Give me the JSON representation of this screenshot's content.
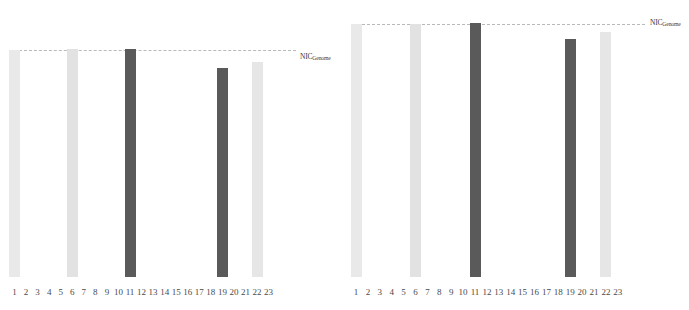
{
  "figure": {
    "width": 689,
    "height": 310,
    "background": "#ffffff"
  },
  "threshold": {
    "label_main": "NIC",
    "label_sub": "Genome",
    "line_color": "#b9b9b9",
    "line_style": "dashed"
  },
  "colors": {
    "light_bar": "#e8e8e8",
    "medium_bar": "#dcdcdc",
    "dark_bar": "#5a5a5a",
    "axis_text": "#4a4a4a"
  },
  "chart_data": [
    {
      "type": "bar",
      "name": "left-panel",
      "title": "",
      "xlabel": "",
      "ylabel": "",
      "grid": false,
      "legend": "none",
      "annotations": [
        "NIC_Genome"
      ],
      "threshold_value": 1.0,
      "ylim": [
        0,
        1.08
      ],
      "categories": [
        "1",
        "2",
        "3",
        "4",
        "5",
        "6",
        "7",
        "8",
        "9",
        "10",
        "11",
        "12",
        "13",
        "14",
        "15",
        "16",
        "17",
        "18",
        "19",
        "20",
        "21",
        "22",
        "23"
      ],
      "values": [
        1.0,
        0,
        0,
        0,
        0,
        1.0,
        0,
        0,
        0,
        0,
        1.0,
        0,
        0,
        0,
        0,
        0,
        0,
        0,
        0.92,
        0,
        0,
        0.95,
        0
      ],
      "bar_colors": [
        "#e9e9e9",
        null,
        null,
        null,
        null,
        "#e2e2e2",
        null,
        null,
        null,
        null,
        "#5a5a5a",
        null,
        null,
        null,
        null,
        null,
        null,
        null,
        "#5a5a5a",
        null,
        null,
        "#e6e6e6",
        null
      ]
    },
    {
      "type": "bar",
      "name": "right-panel",
      "title": "",
      "xlabel": "",
      "ylabel": "",
      "grid": false,
      "legend": "none",
      "annotations": [
        "NIC_Genome"
      ],
      "threshold_value": 1.0,
      "ylim": [
        0,
        1.08
      ],
      "categories": [
        "1",
        "2",
        "3",
        "4",
        "5",
        "6",
        "7",
        "8",
        "9",
        "10",
        "11",
        "12",
        "13",
        "14",
        "15",
        "16",
        "17",
        "18",
        "19",
        "20",
        "21",
        "22",
        "23"
      ],
      "values": [
        1.0,
        0,
        0,
        0,
        0,
        1.0,
        0,
        0,
        0,
        0,
        1.0,
        0,
        0,
        0,
        0,
        0,
        0,
        0,
        0.93,
        0,
        0,
        0.96,
        0
      ],
      "bar_colors": [
        "#e9e9e9",
        null,
        null,
        null,
        null,
        "#e2e2e2",
        null,
        null,
        null,
        null,
        "#5a5a5a",
        null,
        null,
        null,
        null,
        null,
        null,
        null,
        "#5a5a5a",
        null,
        null,
        "#e6e6e6",
        null
      ]
    }
  ],
  "panels": [
    {
      "id": "left-panel",
      "left": 0,
      "plot_left": 14,
      "plot_right": 288,
      "baseline_y": 277,
      "threshold_y": 50,
      "line_x_start": 14,
      "line_x_end": 296,
      "label_x": 300,
      "label_y": 52,
      "tick_start": 14.5,
      "tick_step": 11.55,
      "bar_width": 11,
      "bars": [
        {
          "index": 1,
          "top_y": 50,
          "color": "#e9e9e9"
        },
        {
          "index": 6,
          "top_y": 49,
          "color": "#e2e2e2"
        },
        {
          "index": 11,
          "top_y": 49,
          "color": "#5a5a5a"
        },
        {
          "index": 19,
          "top_y": 68,
          "color": "#5a5a5a"
        },
        {
          "index": 22,
          "top_y": 62,
          "color": "#e6e6e6"
        }
      ]
    },
    {
      "id": "right-panel",
      "left": 345,
      "plot_left": 352,
      "plot_right": 635,
      "baseline_y": 277,
      "threshold_y": 24,
      "line_x_start": 352,
      "line_x_end": 645,
      "label_x": 650,
      "label_y": 18,
      "tick_start": 356,
      "tick_step": 11.9,
      "bar_width": 11,
      "bars": [
        {
          "index": 1,
          "top_y": 24,
          "color": "#e9e9e9"
        },
        {
          "index": 6,
          "top_y": 24,
          "color": "#e2e2e2"
        },
        {
          "index": 11,
          "top_y": 23,
          "color": "#5a5a5a"
        },
        {
          "index": 19,
          "top_y": 39,
          "color": "#5a5a5a"
        },
        {
          "index": 22,
          "top_y": 32,
          "color": "#e6e6e6"
        }
      ]
    }
  ],
  "axis": {
    "tick_labels": [
      "1",
      "2",
      "3",
      "4",
      "5",
      "6",
      "7",
      "8",
      "9",
      "10",
      "11",
      "12",
      "13",
      "14",
      "15",
      "16",
      "17",
      "18",
      "19",
      "20",
      "21",
      "22",
      "23"
    ]
  }
}
